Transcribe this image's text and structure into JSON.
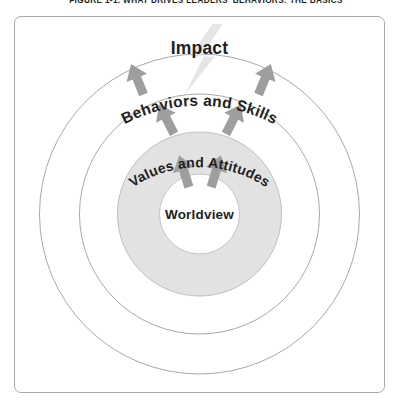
{
  "figure": {
    "caption": "FIGURE 1-1. WHAT DRIVES LEADERS' BEHAVIORS: THE BASICS",
    "panel_border_color": "#a9a9ad",
    "background_color": "#ffffff"
  },
  "diagram": {
    "type": "concentric-circles",
    "rings": [
      {
        "id": "ring-outer",
        "label": "Behaviors and Skills",
        "fill": "#ffffff",
        "stroke": "#a9a9ad",
        "radius": 160,
        "label_curved": true
      },
      {
        "id": "ring-middle",
        "label": "Values and Attitudes",
        "fill": "#ffffff",
        "stroke": "#a9a9ad",
        "radius": 120,
        "label_curved": true
      },
      {
        "id": "ring-inner",
        "label": "",
        "fill": "#e0e0e0",
        "stroke": "#a9a9ad",
        "radius": 82,
        "label_curved": false
      }
    ],
    "core": {
      "id": "core-circle",
      "label": "Worldview",
      "fill": "#ffffff",
      "stroke": "#bdbdbd",
      "radius": 40
    },
    "impact": {
      "label": "Impact",
      "bolt_icon": "lightning-bolt-icon",
      "bolt_color": "#e3e3e3",
      "text_color": "#231f20"
    },
    "arrow_color": "#9e9e9e",
    "arrow_groups": [
      {
        "id": "arrows-core-to-values",
        "count": 2,
        "angles_deg": [
          -20,
          20
        ]
      },
      {
        "id": "arrows-values-to-behaviors",
        "count": 2,
        "angles_deg": [
          -32,
          32
        ]
      },
      {
        "id": "arrows-behaviors-to-impact",
        "count": 2,
        "angles_deg": [
          -42,
          42
        ]
      }
    ],
    "labels": {
      "impact": "Impact",
      "behaviors": "Behaviors and Skills",
      "values": "Values and Attitudes",
      "worldview": "Worldview"
    }
  }
}
